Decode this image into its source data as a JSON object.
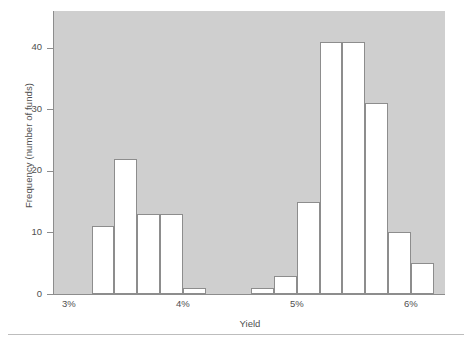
{
  "chart_data": {
    "type": "bar",
    "title": "",
    "subtitle": "",
    "xlabel": "Yield",
    "ylabel": "Frequency (number of funds)",
    "ylim": [
      0,
      46
    ],
    "xlim": [
      2.87,
      6.3
    ],
    "grid": false,
    "legend": null,
    "ytick_labels": [
      "0",
      "10",
      "20",
      "30",
      "40"
    ],
    "ytick_values": [
      0,
      10,
      20,
      30,
      40
    ],
    "xtick_labels": [
      "3%",
      "4%",
      "5%",
      "6%"
    ],
    "xtick_values": [
      3,
      4,
      5,
      6
    ],
    "bin_width": 0.2,
    "bin_edges": [
      3.2,
      3.4,
      3.6,
      3.8,
      4.0,
      4.2,
      4.6,
      4.8,
      5.0,
      5.2,
      5.4,
      5.6,
      5.8,
      6.0,
      6.2
    ],
    "bins": [
      {
        "x0": 3.2,
        "x1": 3.4,
        "value": 11
      },
      {
        "x0": 3.4,
        "x1": 3.6,
        "value": 22
      },
      {
        "x0": 3.6,
        "x1": 3.8,
        "value": 13
      },
      {
        "x0": 3.8,
        "x1": 4.0,
        "value": 13
      },
      {
        "x0": 4.0,
        "x1": 4.2,
        "value": 1
      },
      {
        "x0": 4.6,
        "x1": 4.8,
        "value": 1
      },
      {
        "x0": 4.8,
        "x1": 5.0,
        "value": 3
      },
      {
        "x0": 5.0,
        "x1": 5.2,
        "value": 15
      },
      {
        "x0": 5.2,
        "x1": 5.4,
        "value": 41
      },
      {
        "x0": 5.4,
        "x1": 5.6,
        "value": 41
      },
      {
        "x0": 5.6,
        "x1": 5.8,
        "value": 31
      },
      {
        "x0": 5.8,
        "x1": 6.0,
        "value": 10
      },
      {
        "x0": 6.0,
        "x1": 6.2,
        "value": 5
      }
    ],
    "categories": [
      "3.2-3.4",
      "3.4-3.6",
      "3.6-3.8",
      "3.8-4.0",
      "4.0-4.2",
      "4.6-4.8",
      "4.8-5.0",
      "5.0-5.2",
      "5.2-5.4",
      "5.4-5.6",
      "5.6-5.8",
      "5.8-6.0",
      "6.0-6.2"
    ],
    "values": [
      11,
      22,
      13,
      13,
      1,
      1,
      3,
      15,
      41,
      41,
      31,
      10,
      5
    ],
    "colors": {
      "plot_background": "#cfcfcf",
      "bar_fill": "#ffffff",
      "bar_stroke": "#8d8d8d",
      "axis": "#8d8d8d",
      "text": "#4f4f4f",
      "page_background": "#ffffff"
    }
  }
}
